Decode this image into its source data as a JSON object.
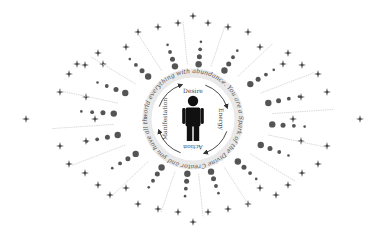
{
  "diagram": {
    "center": {
      "x": 193,
      "y": 119
    },
    "figure": {
      "label": "person",
      "color": "#111111"
    },
    "cycle": {
      "radius": 34,
      "labels": [
        {
          "text": "Desire",
          "angle": -90
        },
        {
          "text": "Energy",
          "angle": 0
        },
        {
          "text": "Action",
          "angle": 90
        },
        {
          "text": "Manifestation",
          "angle": 180
        }
      ],
      "arrow_color": "#333333"
    },
    "ring_text": "world everything with abundance. You are a Spark of the Divine Creator and you have all the power to manifest your desires. Fill the",
    "ring": {
      "radius": 46,
      "band_color": "#e6e6e6",
      "text_color": "#555555"
    },
    "rays": {
      "count": 16,
      "dot_color": "#555555",
      "line_color": "#cfcfcf",
      "text_color": "#b8b8b8",
      "labels": [
        "Energy flows to desire",
        "Inspired action",
        "Attention and intention",
        "Gratitude and joy",
        "Believe in yourself",
        "Feel it as real",
        "Trust the universe",
        "Let it flow",
        "Focus on the good",
        "Be the change",
        "Thoughts become things",
        "Ask and receive",
        "Vibrate higher",
        "Abundance is here",
        "Love and light",
        "Create your reality"
      ]
    },
    "stars": {
      "color": "#444444"
    }
  }
}
